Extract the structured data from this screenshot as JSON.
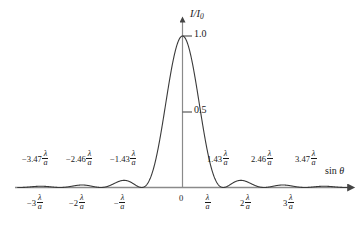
{
  "figure": {
    "type": "single-slit-diffraction-intensity-plot",
    "background_color": "#ffffff",
    "line_color": "#1a1a1a",
    "axis_color": "#7a7a7a"
  },
  "axes": {
    "y_title": "I/I",
    "y_title_sub": "0",
    "x_title_prefix": "sin ",
    "x_title_symbol": "θ",
    "y_ticks": [
      {
        "value": 1.0,
        "label": "1.0"
      },
      {
        "value": 0.5,
        "label": "0.5"
      }
    ],
    "origin_label": "0"
  },
  "x_tick_labels": [
    {
      "coef": "−3",
      "num": "λ",
      "den": "a"
    },
    {
      "coef": "−2",
      "num": "λ",
      "den": "a"
    },
    {
      "coef": "−",
      "num": "λ",
      "den": "a"
    },
    {
      "coef": "",
      "num": "λ",
      "den": "a"
    },
    {
      "coef": "2",
      "num": "λ",
      "den": "a"
    },
    {
      "coef": "3",
      "num": "λ",
      "den": "a"
    }
  ],
  "peak_labels": [
    {
      "coef": "−3.47",
      "num": "λ",
      "den": "a"
    },
    {
      "coef": "−2.46",
      "num": "λ",
      "den": "a"
    },
    {
      "coef": "−1.43",
      "num": "λ",
      "den": "a"
    },
    {
      "coef": "1.43",
      "num": "λ",
      "den": "a"
    },
    {
      "coef": "2.46",
      "num": "λ",
      "den": "a"
    },
    {
      "coef": "3.47",
      "num": "λ",
      "den": "a"
    }
  ],
  "chart_data": {
    "type": "line",
    "title": "",
    "xlabel": "sin θ",
    "ylabel": "I/I0",
    "xlim": [
      -4.05,
      4.05
    ],
    "ylim": [
      0,
      1.06
    ],
    "grid": false,
    "legend": null,
    "function": "sinc-squared",
    "formula": "I/I0 = (sin(pi*x)/(pi*x))^2, x in units of lambda/a",
    "x_units": "lambda/a",
    "x_ticks": [
      -3,
      -2,
      -1,
      0,
      1,
      2,
      3
    ],
    "y_ticks": [
      0.5,
      1.0
    ],
    "zeros": [
      -4,
      -3,
      -2,
      -1,
      1,
      2,
      3,
      4
    ],
    "maxima": [
      {
        "x": 0,
        "y": 1.0
      },
      {
        "x": 1.43,
        "y": 0.047
      },
      {
        "x": -1.43,
        "y": 0.047
      },
      {
        "x": 2.46,
        "y": 0.017
      },
      {
        "x": -2.46,
        "y": 0.017
      },
      {
        "x": 3.47,
        "y": 0.008
      },
      {
        "x": -3.47,
        "y": 0.008
      }
    ],
    "series": [
      {
        "name": "I/I0",
        "x": [
          -4.0,
          -3.8,
          -3.6,
          -3.47,
          -3.4,
          -3.2,
          -3.0,
          -2.8,
          -2.6,
          -2.46,
          -2.4,
          -2.2,
          -2.0,
          -1.8,
          -1.6,
          -1.43,
          -1.4,
          -1.2,
          -1.0,
          -0.9,
          -0.8,
          -0.7,
          -0.6,
          -0.5,
          -0.4,
          -0.3,
          -0.2,
          -0.1,
          0.0,
          0.1,
          0.2,
          0.3,
          0.4,
          0.5,
          0.6,
          0.7,
          0.8,
          0.9,
          1.0,
          1.2,
          1.4,
          1.43,
          1.6,
          1.8,
          2.0,
          2.2,
          2.4,
          2.46,
          2.6,
          2.8,
          3.0,
          3.2,
          3.4,
          3.47,
          3.6,
          3.8,
          4.0
        ],
        "y": [
          0.0,
          0.0029,
          0.0071,
          0.0083,
          0.0081,
          0.0046,
          0.0,
          0.0055,
          0.0146,
          0.0165,
          0.0162,
          0.0097,
          0.0,
          0.0125,
          0.0368,
          0.0472,
          0.0465,
          0.0336,
          0.0,
          0.0109,
          0.0547,
          0.1261,
          0.2172,
          0.3183,
          0.422,
          0.5191,
          0.6055,
          0.6752,
          1.0,
          0.6752,
          0.6055,
          0.5191,
          0.422,
          0.3183,
          0.2172,
          0.1261,
          0.0547,
          0.0109,
          0.0,
          0.0336,
          0.0465,
          0.0472,
          0.0368,
          0.0125,
          0.0,
          0.0097,
          0.0162,
          0.0165,
          0.0146,
          0.0055,
          0.0,
          0.0046,
          0.0081,
          0.0083,
          0.0071,
          0.0029,
          0.0
        ]
      }
    ]
  }
}
